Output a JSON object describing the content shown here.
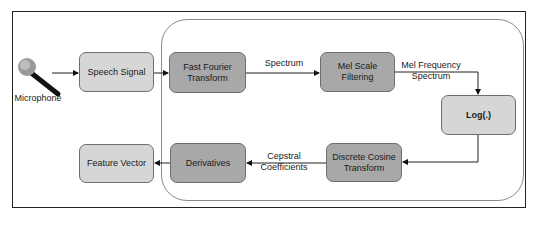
{
  "diagram": {
    "source": {
      "label": "Microphone",
      "icon": "microphone-icon"
    },
    "nodes": [
      {
        "id": "speech_signal",
        "label": "Speech Signal",
        "style": "light"
      },
      {
        "id": "fft",
        "label": "Fast Fourier Transform",
        "line1": "Fast Fourier",
        "line2": "Transform",
        "style": "dark"
      },
      {
        "id": "mel",
        "label": "Mel Scale Filtering",
        "line1": "Mel Scale",
        "line2": "Filtering",
        "style": "dark"
      },
      {
        "id": "log",
        "label": "Log(.)",
        "style": "light"
      },
      {
        "id": "dct",
        "label": "Discrete Cosine Transform",
        "line1": "Discrete Cosine",
        "line2": "Transform",
        "style": "dark"
      },
      {
        "id": "derivatives",
        "label": "Derivatives",
        "style": "dark"
      },
      {
        "id": "feature_vector",
        "label": "Feature Vector",
        "style": "light"
      }
    ],
    "edges": [
      {
        "from": "microphone",
        "to": "speech_signal",
        "label": ""
      },
      {
        "from": "speech_signal",
        "to": "fft",
        "label": ""
      },
      {
        "from": "fft",
        "to": "mel",
        "label": "Spectrum"
      },
      {
        "from": "mel",
        "to": "log",
        "label": "Mel Frequency Spectrum",
        "line1": "Mel Frequency",
        "line2": "Spectrum"
      },
      {
        "from": "log",
        "to": "dct",
        "label": ""
      },
      {
        "from": "dct",
        "to": "derivatives",
        "label": "Cepstral Coefficients",
        "line1": "Cepstral",
        "line2": "Coefficients"
      },
      {
        "from": "derivatives",
        "to": "feature_vector",
        "label": ""
      }
    ],
    "colors": {
      "light_box": "#d6d6d6",
      "dark_box": "#a8a8a8",
      "border": "#6e6e6e",
      "frame": "#222222",
      "container": "#8a8a8a"
    }
  }
}
